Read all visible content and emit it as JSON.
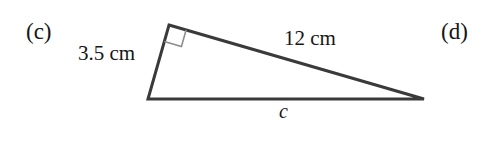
{
  "figure": {
    "type": "right-triangle-diagram",
    "background_color": "#ffffff",
    "stroke_color": "#3a3a3a",
    "text_color": "#161616",
    "right_angle_marker_color": "#8c8c8c",
    "part_labels": {
      "left": "(c)",
      "right": "(d)"
    },
    "sides": {
      "vertical_leg": {
        "value": "3.5",
        "unit": "cm",
        "label": "3.5 cm"
      },
      "hypotenuse_leg": {
        "value": "12",
        "unit": "cm",
        "label": "12 cm"
      },
      "base": {
        "label": "c"
      }
    },
    "vertices": {
      "top": {
        "x": 169,
        "y": 25
      },
      "bottom_left": {
        "x": 148,
        "y": 99
      },
      "right": {
        "x": 424,
        "y": 99
      }
    },
    "right_angle_at": "top"
  }
}
